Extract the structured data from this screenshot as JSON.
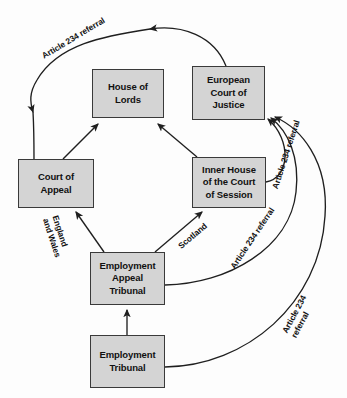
{
  "diagram": {
    "background_color": "#fdfdfd",
    "node_fill_color": "#d4d4d4",
    "node_border_color": "#3a3a3a",
    "edge_color": "#1f1f1f",
    "nodes": [
      {
        "id": "house-of-lords",
        "label": "House of\nLords",
        "x": 92,
        "y": 69,
        "width": 72,
        "height": 49
      },
      {
        "id": "european-court-of-justice",
        "label": "European\nCourt of\nJustice",
        "x": 192,
        "y": 66,
        "width": 73,
        "height": 54
      },
      {
        "id": "court-of-appeal",
        "label": "Court of\nAppeal",
        "x": 18,
        "y": 159,
        "width": 76,
        "height": 49
      },
      {
        "id": "inner-house-court-of-session",
        "label": "Inner House\nof the Court\nof Session",
        "x": 192,
        "y": 157,
        "width": 74,
        "height": 51
      },
      {
        "id": "employment-appeal-tribunal",
        "label": "Employment\nAppeal\nTribunal",
        "x": 90,
        "y": 252,
        "width": 75,
        "height": 53
      },
      {
        "id": "employment-tribunal",
        "label": "Employment\nTribunal",
        "x": 90,
        "y": 335,
        "width": 75,
        "height": 53
      }
    ],
    "edge_labels": [
      {
        "id": "article-234-referral-top-left",
        "text": "Article 234 referral",
        "x": 40,
        "y": 52,
        "rotation": -31
      },
      {
        "id": "article-234-referral-ecj-inner-house",
        "text": "Article 234 referral",
        "x": 270,
        "y": 187,
        "rotation": -72
      },
      {
        "id": "article-234-referral-ecj-eat",
        "text": "Article 234 referral",
        "x": 228,
        "y": 265,
        "rotation": -56
      },
      {
        "id": "article-234-referral-ecj-et",
        "text": "Article 234 referral",
        "x": 280,
        "y": 330,
        "rotation": -62
      },
      {
        "id": "england-and-wales",
        "text": "England\nand Wales",
        "x": 60,
        "y": 214,
        "rotation": 72
      },
      {
        "id": "scotland",
        "text": "Scotland",
        "x": 176,
        "y": 243,
        "rotation": -40
      }
    ],
    "edges": [
      {
        "id": "ecj-to-court-of-appeal",
        "from": "european-court-of-justice",
        "to": "court-of-appeal",
        "label": "Article 234 referral"
      },
      {
        "id": "court-of-appeal-to-house-of-lords",
        "from": "court-of-appeal",
        "to": "house-of-lords",
        "label": ""
      },
      {
        "id": "inner-house-to-house-of-lords",
        "from": "inner-house-court-of-session",
        "to": "house-of-lords",
        "label": ""
      },
      {
        "id": "eat-to-court-of-appeal",
        "from": "employment-appeal-tribunal",
        "to": "court-of-appeal",
        "label": "England and Wales"
      },
      {
        "id": "eat-to-inner-house",
        "from": "employment-appeal-tribunal",
        "to": "inner-house-court-of-session",
        "label": "Scotland"
      },
      {
        "id": "employment-tribunal-to-eat",
        "from": "employment-tribunal",
        "to": "employment-appeal-tribunal",
        "label": ""
      },
      {
        "id": "inner-house-to-ecj",
        "from": "inner-house-court-of-session",
        "to": "european-court-of-justice",
        "label": "Article 234 referral"
      },
      {
        "id": "eat-to-ecj",
        "from": "employment-appeal-tribunal",
        "to": "european-court-of-justice",
        "label": "Article 234 referral"
      },
      {
        "id": "employment-tribunal-to-ecj",
        "from": "employment-tribunal",
        "to": "european-court-of-justice",
        "label": "Article 234 referral"
      }
    ]
  }
}
